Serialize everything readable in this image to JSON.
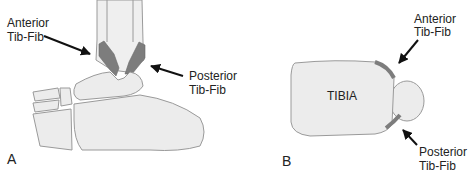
{
  "figure": {
    "panel_a": {
      "letter": "A",
      "view": "lateral ankle",
      "labels": {
        "anterior": [
          "Anterior",
          "Tib-Fib"
        ],
        "posterior": [
          "Posterior",
          "Tib-Fib"
        ]
      }
    },
    "panel_b": {
      "letter": "B",
      "view": "axial cross-section",
      "bone_label": "TIBIA",
      "labels": {
        "anterior": [
          "Anterior",
          "Tib-Fib"
        ],
        "posterior": [
          "Posterior",
          "Tib-Fib"
        ]
      }
    }
  },
  "colors": {
    "bone_fill": "#ececec",
    "bone_stroke": "#9a9a9a",
    "ligament": "#7d7d7d",
    "arrow": "#111111",
    "text": "#222222"
  }
}
